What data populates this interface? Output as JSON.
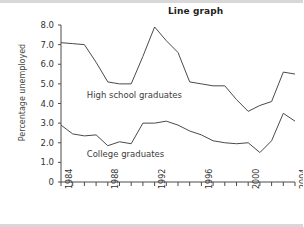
{
  "chart_data": {
    "type": "line",
    "title": "Line graph",
    "xlabel": "",
    "ylabel": "Percentage unemployed",
    "xlim": [
      1984,
      2004
    ],
    "ylim": [
      0,
      8.0
    ],
    "grid": false,
    "legend_position": "inline-annotation",
    "y_ticks": [
      "8.0",
      "7.0",
      "6.0",
      "5.0",
      "4.0",
      "3.0",
      "2.0",
      "1.0",
      "0"
    ],
    "y_tick_values": [
      8.0,
      7.0,
      6.0,
      5.0,
      4.0,
      3.0,
      2.0,
      1.0,
      0
    ],
    "x_ticks_all": [
      1984,
      1985,
      1986,
      1987,
      1988,
      1989,
      1990,
      1991,
      1992,
      1993,
      1994,
      1995,
      1996,
      1997,
      1998,
      1999,
      2000,
      2001,
      2002,
      2003,
      2004
    ],
    "x_tick_labels": [
      "1984",
      "1988",
      "1992",
      "1996",
      "2000",
      "2004"
    ],
    "x_tick_labeled_values": [
      1984,
      1988,
      1992,
      1996,
      2000,
      2004
    ],
    "x": [
      1984,
      1985,
      1986,
      1987,
      1988,
      1989,
      1990,
      1991,
      1992,
      1993,
      1994,
      1995,
      1996,
      1997,
      1998,
      1999,
      2000,
      2001,
      2002,
      2003,
      2004
    ],
    "series": [
      {
        "name": "High school graduates",
        "label_text": "High school graduates",
        "color": "#4a4a4a",
        "values": [
          7.1,
          7.05,
          7.0,
          6.1,
          5.1,
          5.0,
          5.0,
          6.4,
          7.9,
          7.2,
          6.6,
          5.1,
          5.0,
          4.9,
          4.9,
          4.2,
          3.6,
          3.9,
          4.1,
          5.6,
          5.5
        ]
      },
      {
        "name": "College graduates",
        "label_text": "College graduates",
        "color": "#4a4a4a",
        "values": [
          2.9,
          2.45,
          2.35,
          2.4,
          1.85,
          2.05,
          1.95,
          3.0,
          3.0,
          3.1,
          2.9,
          2.6,
          2.4,
          2.1,
          2.0,
          1.95,
          2.0,
          1.5,
          2.1,
          3.5,
          3.1
        ]
      }
    ],
    "annotations": [
      {
        "text": "High school graduates",
        "x": 1986.2,
        "y": 4.45
      },
      {
        "text": "College graduates",
        "x": 1986.2,
        "y": 1.45
      }
    ]
  }
}
